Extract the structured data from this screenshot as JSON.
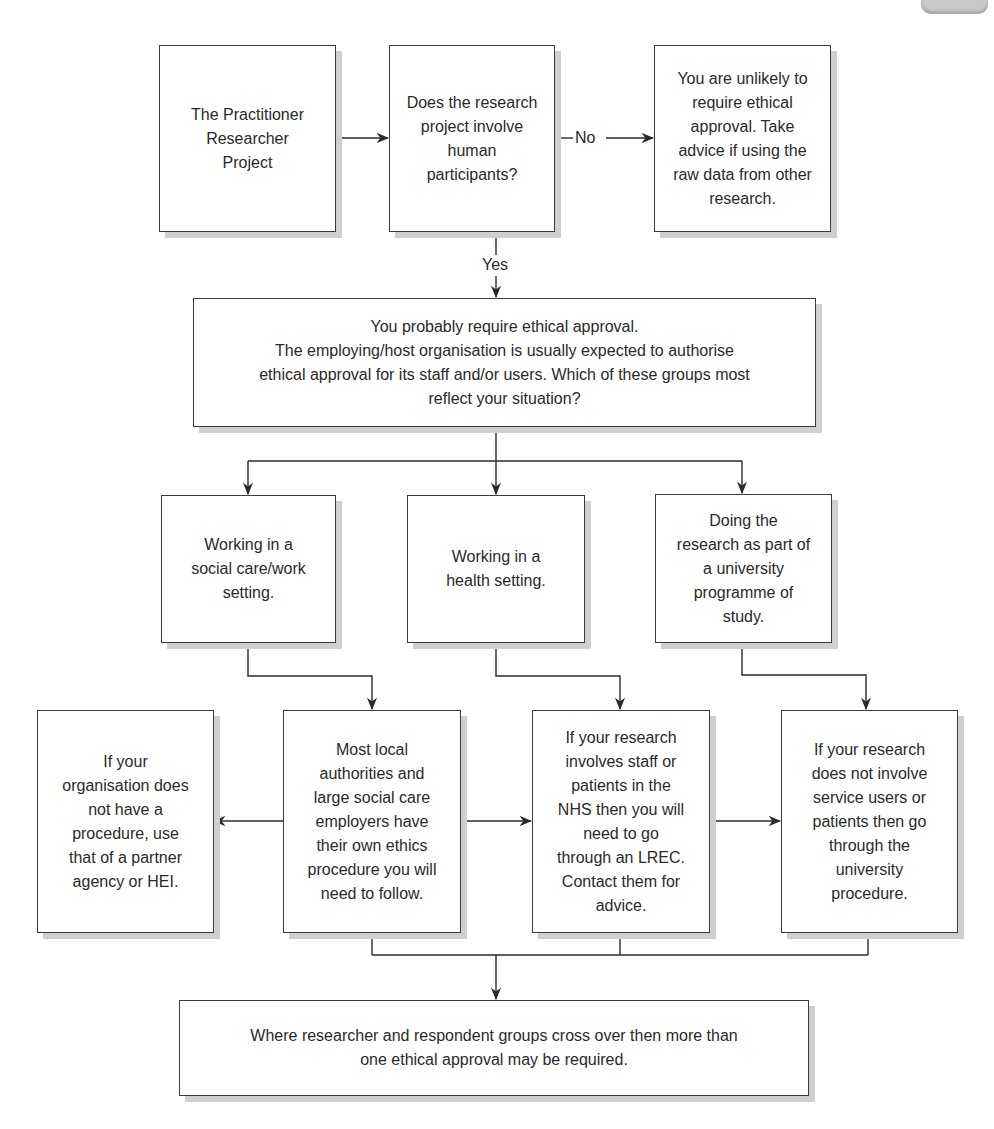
{
  "diagram": {
    "type": "flowchart",
    "corner_tab": "page-tab",
    "nodes": {
      "start": "The Practitioner\nResearcher\nProject",
      "question": "Does the research\nproject involve\nhuman\nparticipants?",
      "no_outcome": "You are unlikely to\nrequire ethical\napproval. Take\nadvice if using the\nraw data from other\nresearch.",
      "yes_outcome": "You probably require ethical approval.\nThe employing/host organisation is usually expected to authorise\nethical approval for its staff and/or users. Which of these groups most\nreflect your situation?",
      "social": "Working in a\nsocial care/work\nsetting.",
      "health": "Working in a\nhealth setting.",
      "university": "Doing the\nresearch as part of\na university\nprogramme of\nstudy.",
      "partner": "If your\norganisation does\nnot have a\nprocedure, use\nthat of a partner\nagency or HEI.",
      "local_authorities": "Most local\nauthorities and\nlarge social care\nemployers have\ntheir own ethics\nprocedure you will\nneed to follow.",
      "nhs": "If your research\ninvolves staff or\npatients in the\nNHS then you will\nneed to go\nthrough an LREC.\nContact them for\nadvice.",
      "university_procedure": "If your research\ndoes not involve\nservice users or\npatients then go\nthrough the\nuniversity\nprocedure.",
      "final": "Where researcher and respondent groups cross over then more than\none ethical approval may be required."
    },
    "edge_labels": {
      "no": "No",
      "yes": "Yes"
    },
    "edges": [
      {
        "from": "start",
        "to": "question"
      },
      {
        "from": "question",
        "to": "no_outcome",
        "label": "No"
      },
      {
        "from": "question",
        "to": "yes_outcome",
        "label": "Yes"
      },
      {
        "from": "yes_outcome",
        "to": "social"
      },
      {
        "from": "yes_outcome",
        "to": "health"
      },
      {
        "from": "yes_outcome",
        "to": "university"
      },
      {
        "from": "social",
        "to": "local_authorities"
      },
      {
        "from": "health",
        "to": "nhs"
      },
      {
        "from": "university",
        "to": "university_procedure"
      },
      {
        "from": "local_authorities",
        "to": "partner"
      },
      {
        "from": "local_authorities",
        "to": "nhs"
      },
      {
        "from": "nhs",
        "to": "university_procedure"
      },
      {
        "from": "local_authorities",
        "to": "final"
      },
      {
        "from": "nhs",
        "to": "final"
      },
      {
        "from": "university_procedure",
        "to": "final"
      }
    ],
    "colors": {
      "line": "#2a2a2a",
      "shadow": "#cfcfcf",
      "tab": "#c9c9c9"
    }
  }
}
